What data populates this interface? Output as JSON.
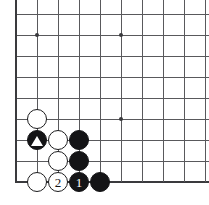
{
  "diagram": {
    "type": "go-board",
    "board": {
      "origin_x": 16,
      "origin_y": 14,
      "spacing": 21,
      "cols": 10,
      "rows": 9,
      "line_color": "#59595c",
      "edge_color": "#3a3a3d",
      "background_color": "#ffffff",
      "left_edge_is_board_border": true,
      "bottom_edge_is_board_border": true,
      "top_edge_cropped": true,
      "right_edge_cropped": true
    },
    "star_points": [
      {
        "name": "star-point-upper-left",
        "col": 2,
        "row": 2
      },
      {
        "name": "star-point-upper-right",
        "col": 6,
        "row": 2
      },
      {
        "name": "star-point-lower-right",
        "col": 6,
        "row": 6
      }
    ],
    "stones": [
      {
        "name": "white-stone-a",
        "color": "white",
        "col": 2,
        "row": 6,
        "label": "",
        "marker": ""
      },
      {
        "name": "white-stone-b",
        "color": "white",
        "col": 3,
        "row": 7,
        "label": "",
        "marker": ""
      },
      {
        "name": "black-stone-marked",
        "color": "black",
        "col": 2,
        "row": 7,
        "label": "",
        "marker": "triangle"
      },
      {
        "name": "black-stone-c",
        "color": "black",
        "col": 4,
        "row": 7,
        "label": "",
        "marker": ""
      },
      {
        "name": "white-stone-c",
        "color": "white",
        "col": 3,
        "row": 8,
        "label": "",
        "marker": ""
      },
      {
        "name": "black-stone-d",
        "color": "black",
        "col": 4,
        "row": 8,
        "label": "",
        "marker": ""
      },
      {
        "name": "white-stone-move-2",
        "color": "white",
        "col": 3,
        "row": 9,
        "label": "2",
        "marker": ""
      },
      {
        "name": "black-stone-move-1",
        "color": "black",
        "col": 4,
        "row": 9,
        "label": "1",
        "marker": ""
      },
      {
        "name": "black-stone-e",
        "color": "black",
        "col": 5,
        "row": 9,
        "label": "",
        "marker": ""
      },
      {
        "name": "white-stone-d",
        "color": "white",
        "col": 2,
        "row": 9,
        "label": "",
        "marker": ""
      }
    ],
    "colors": {
      "black_stone": "#141416",
      "white_stone": "#ffffff",
      "stone_outline": "#1b1b1d",
      "grid": "#59595c",
      "board_edge": "#3a3a3d",
      "marker": "#ffffff"
    }
  }
}
